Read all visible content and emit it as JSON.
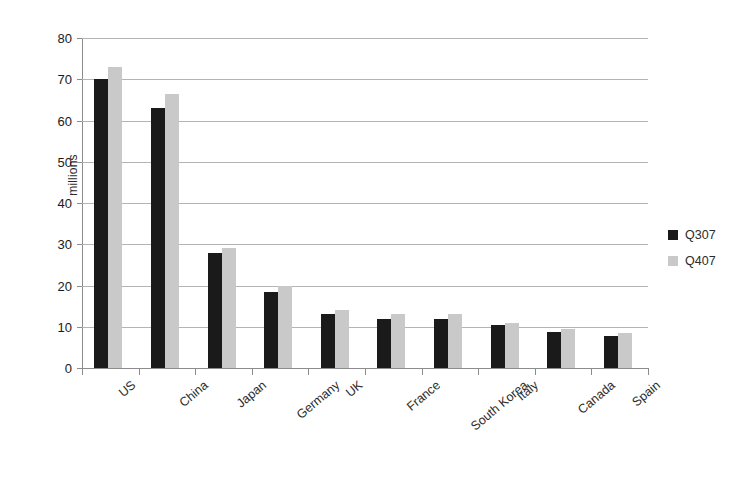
{
  "chart_data": {
    "type": "bar",
    "title": "",
    "subtitle": "",
    "xlabel": "",
    "ylabel": "millions",
    "ylim": [
      0,
      80
    ],
    "ytick_step": 10,
    "yticks": [
      0,
      10,
      20,
      30,
      40,
      50,
      60,
      70,
      80
    ],
    "grid": true,
    "grid_axis": "y",
    "legend_position": "right",
    "categories": [
      "US",
      "China",
      "Japan",
      "Germany",
      "UK",
      "France",
      "South Korea",
      "Italy",
      "Canada",
      "Spain"
    ],
    "series": [
      {
        "name": "Q307",
        "color": "#1a1a1a",
        "values": [
          70,
          63,
          28,
          18.5,
          13,
          12,
          12,
          10.5,
          8.7,
          7.8
        ]
      },
      {
        "name": "Q407",
        "color": "#c9c9c9",
        "values": [
          73,
          66.5,
          29,
          20,
          14,
          13,
          13.2,
          11,
          9.5,
          8.4
        ]
      }
    ]
  },
  "legend": {
    "entries": [
      {
        "label": "Q307",
        "swatch": "dark-square-swatch"
      },
      {
        "label": "Q407",
        "swatch": "light-square-swatch"
      }
    ]
  }
}
